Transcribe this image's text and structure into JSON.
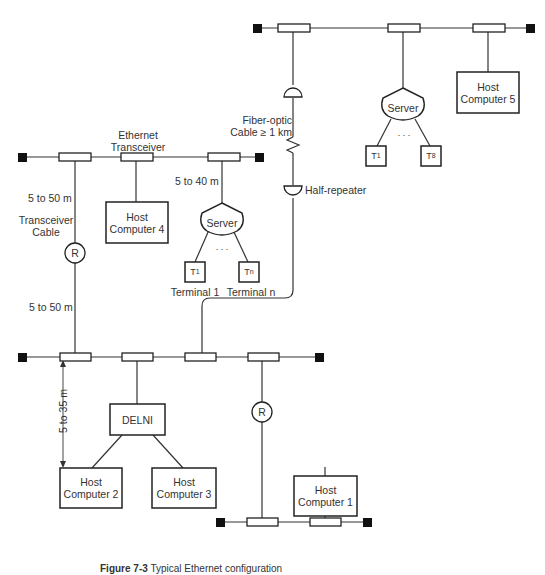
{
  "caption": {
    "prefix": "Figure 7-3",
    "text": "Typical Ethernet configuration"
  },
  "labels": {
    "ethernet_transceiver": "Ethernet\nTransceiver",
    "ethernet_transceiver_l1": "Ethernet",
    "ethernet_transceiver_l2": "Transceiver",
    "transceiver_cable_l1": "Transceiver",
    "transceiver_cable_l2": "Cable",
    "dist_5_50_top": "5 to 50 m",
    "dist_5_50_bottom": "5 to 50 m",
    "dist_5_40": "5 to 40 m",
    "dist_5_35": "5 to 35 m",
    "fiber_l1": "Fiber-optic",
    "fiber_l2": "Cable ≥ 1 km",
    "half_repeater": "Half-repeater",
    "repeater_symbol": "R",
    "ellipsis": ". . ."
  },
  "nodes": {
    "host1": {
      "l1": "Host",
      "l2": "Computer 1"
    },
    "host2": {
      "l1": "Host",
      "l2": "Computer 2"
    },
    "host3": {
      "l1": "Host",
      "l2": "Computer 3"
    },
    "host4": {
      "l1": "Host",
      "l2": "Computer 4"
    },
    "host5": {
      "l1": "Host",
      "l2": "Computer 5"
    },
    "delni": {
      "label": "DELNI"
    },
    "server_left": {
      "label": "Server"
    },
    "server_right": {
      "label": "Server"
    },
    "terminal_left_1": {
      "t": "T",
      "sub": "1",
      "caption": "Terminal 1"
    },
    "terminal_left_n": {
      "t": "T",
      "sub": "n",
      "caption": "Terminal n"
    },
    "terminal_right_1": {
      "t": "T",
      "sub": "1"
    },
    "terminal_right_8": {
      "t": "T",
      "sub": "8"
    }
  }
}
